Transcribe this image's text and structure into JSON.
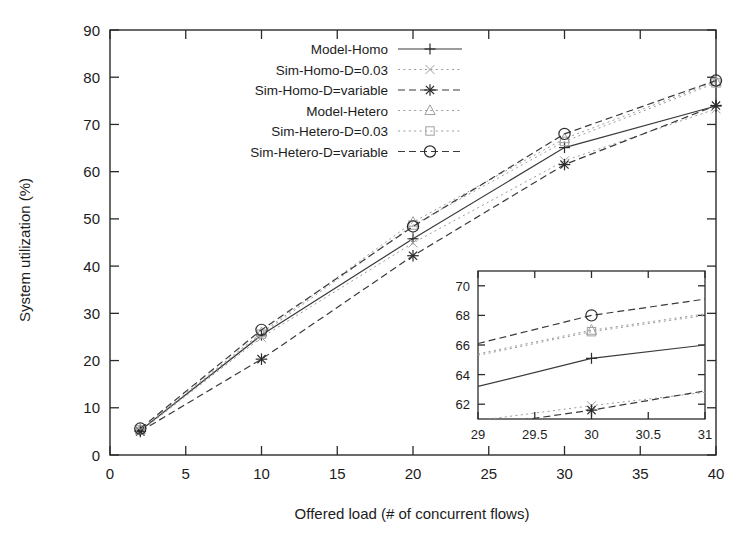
{
  "chart_data": {
    "type": "line",
    "title": "",
    "xlabel": "Offered load (# of concurrent flows)",
    "ylabel": "System utilization (%)",
    "xlim": [
      0,
      40
    ],
    "ylim": [
      0,
      90
    ],
    "xticks": [
      "0",
      "5",
      "10",
      "15",
      "20",
      "25",
      "30",
      "35",
      "40"
    ],
    "xtick_values": [
      0,
      5,
      10,
      15,
      20,
      25,
      30,
      35,
      40
    ],
    "yticks": [
      "0",
      "10",
      "20",
      "30",
      "40",
      "50",
      "60",
      "70",
      "80",
      "90"
    ],
    "ytick_values": [
      0,
      10,
      20,
      30,
      40,
      50,
      60,
      70,
      80,
      90
    ],
    "grid": false,
    "legend_position": "top-center",
    "x": [
      2,
      10,
      20,
      30,
      40
    ],
    "series": [
      {
        "name": "Model-Homo",
        "marker": "plus",
        "linestyle": "solid",
        "tone": "dark",
        "values": [
          5.2,
          25.4,
          45.8,
          65.1,
          73.9
        ]
      },
      {
        "name": "Sim-Homo-D=0.03",
        "marker": "cross-faint",
        "linestyle": "dotted",
        "tone": "faint",
        "values": [
          5.0,
          24.9,
          44.9,
          62.3,
          73.3
        ]
      },
      {
        "name": "Sim-Homo-D=variable",
        "marker": "star",
        "linestyle": "dashed",
        "tone": "dark",
        "values": [
          5.0,
          20.3,
          42.2,
          61.5,
          74.0
        ]
      },
      {
        "name": "Model-Hetero",
        "marker": "triangle",
        "linestyle": "dotted",
        "tone": "faint",
        "values": [
          5.4,
          25.9,
          49.3,
          67.0,
          79.1
        ]
      },
      {
        "name": "Sim-Hetero-D=0.03",
        "marker": "square-faint",
        "linestyle": "dotted",
        "tone": "faint",
        "values": [
          5.3,
          25.6,
          48.7,
          66.4,
          78.8
        ]
      },
      {
        "name": "Sim-Hetero-D=variable",
        "marker": "circle",
        "linestyle": "dashed",
        "tone": "dark",
        "values": [
          5.6,
          26.5,
          48.4,
          68.0,
          79.3
        ]
      }
    ],
    "inset": {
      "xlim": [
        29,
        31
      ],
      "ylim": [
        61,
        71
      ],
      "xticks": [
        "29",
        "29.5",
        "30",
        "30.5",
        "31"
      ],
      "xtick_values": [
        29,
        29.5,
        30,
        30.5,
        31
      ],
      "yticks": [
        "62",
        "64",
        "66",
        "68",
        "70"
      ],
      "ytick_values": [
        62,
        64,
        66,
        68,
        70
      ],
      "x": [
        29,
        30,
        31
      ],
      "series": [
        {
          "name": "Model-Homo",
          "marker": "plus",
          "linestyle": "solid",
          "tone": "dark",
          "values": [
            63.2,
            65.1,
            66.0
          ]
        },
        {
          "name": "Sim-Homo-D=0.03",
          "marker": "cross-faint",
          "linestyle": "dotted",
          "tone": "faint",
          "values": [
            60.9,
            61.9,
            62.8
          ]
        },
        {
          "name": "Sim-Homo-D=variable",
          "marker": "star",
          "linestyle": "dashed",
          "tone": "dark",
          "values": [
            60.5,
            61.6,
            62.9
          ]
        },
        {
          "name": "Model-Hetero",
          "marker": "triangle",
          "linestyle": "dotted",
          "tone": "faint",
          "values": [
            65.4,
            67.0,
            68.1
          ]
        },
        {
          "name": "Sim-Hetero-D=0.03",
          "marker": "square-faint",
          "linestyle": "dotted",
          "tone": "faint",
          "values": [
            65.3,
            66.9,
            68.0
          ]
        },
        {
          "name": "Sim-Hetero-D=variable",
          "marker": "circle",
          "linestyle": "dashed",
          "tone": "dark",
          "values": [
            66.1,
            68.0,
            69.1
          ]
        }
      ]
    }
  },
  "legend": {
    "entries": [
      {
        "label": "Model-Homo"
      },
      {
        "label": "Sim-Homo-D=0.03"
      },
      {
        "label": "Sim-Homo-D=variable"
      },
      {
        "label": "Model-Hetero"
      },
      {
        "label": "Sim-Hetero-D=0.03"
      },
      {
        "label": "Sim-Hetero-D=variable"
      }
    ]
  },
  "colors": {
    "axis": "#2b2b2b",
    "line_dark": "#3a3a3a",
    "line_faint": "#9a9a9a",
    "background": "#ffffff"
  }
}
